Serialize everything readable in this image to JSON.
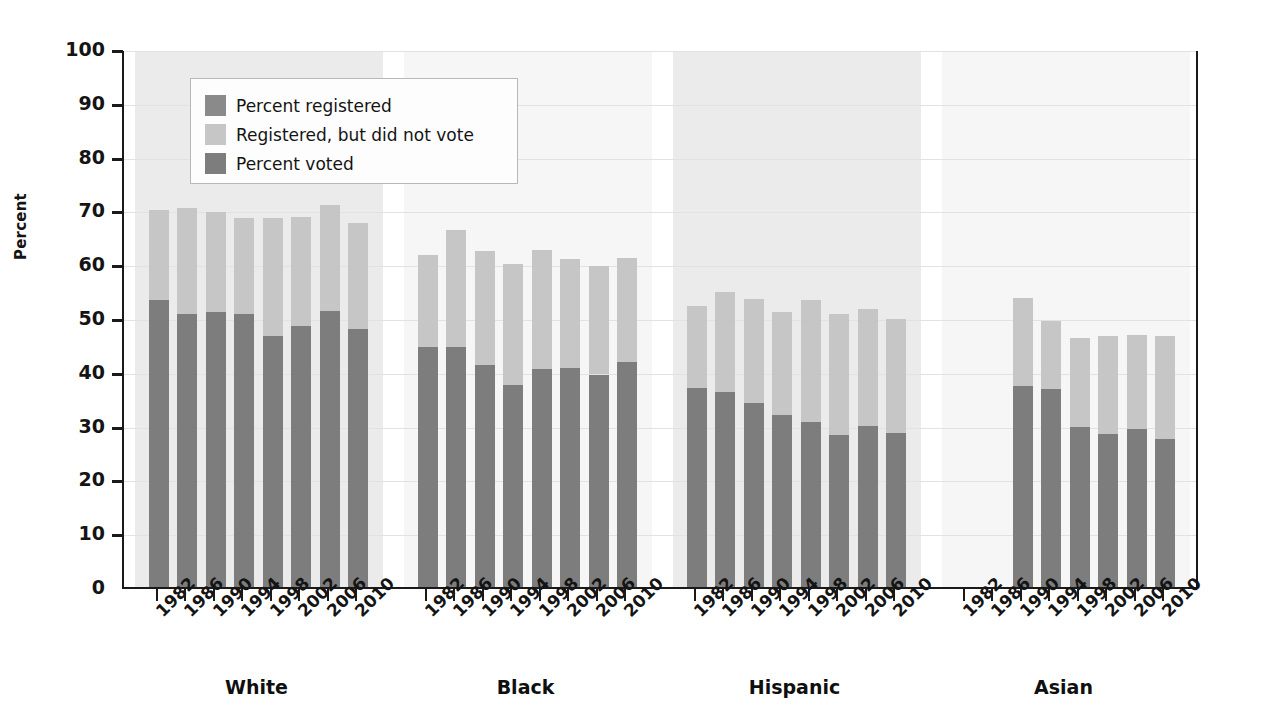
{
  "chart_data": {
    "type": "bar",
    "title": "",
    "subtitle": "",
    "xlabel": "",
    "ylabel": "Percent",
    "ylim": [
      0,
      100
    ],
    "ytick_step": 10,
    "yticks": [
      "100",
      "90",
      "80",
      "70",
      "60",
      "50",
      "40",
      "30",
      "20",
      "10",
      "0"
    ],
    "grid": true,
    "stacked": true,
    "legend_position": "upper-left-inside",
    "legend": [
      {
        "label": "Percent registered",
        "color": "#8a8a8a"
      },
      {
        "label": "Registered, but did not vote",
        "color": "#c6c6c6"
      },
      {
        "label": "Percent voted",
        "color": "#7d7d7d"
      }
    ],
    "categories": [
      "1982",
      "1986",
      "1990",
      "1994",
      "1998",
      "2002",
      "2006",
      "2010"
    ],
    "groups": [
      {
        "name": "White",
        "registered": [
          70.0,
          70.4,
          69.7,
          68.5,
          68.6,
          68.8,
          71.0,
          67.7
        ],
        "voted": [
          53.4,
          50.7,
          51.2,
          50.8,
          46.7,
          48.6,
          51.3,
          48.0
        ]
      },
      {
        "name": "Black",
        "registered": [
          61.7,
          66.3,
          62.4,
          60.1,
          62.6,
          61.0,
          59.6,
          61.2
        ],
        "voted": [
          44.7,
          44.6,
          41.2,
          37.5,
          40.5,
          40.8,
          39.5,
          41.8
        ]
      },
      {
        "name": "Hispanic",
        "registered": [
          52.2,
          54.9,
          53.6,
          51.2,
          53.4,
          50.7,
          51.7,
          49.8
        ],
        "voted": [
          36.9,
          36.2,
          34.2,
          31.9,
          30.7,
          28.3,
          30.0,
          28.6
        ]
      },
      {
        "name": "Asian",
        "registered": [
          null,
          null,
          53.7,
          49.5,
          46.2,
          46.6,
          46.8,
          46.6
        ],
        "voted": [
          null,
          null,
          37.4,
          36.8,
          29.7,
          28.4,
          29.4,
          27.6
        ]
      }
    ],
    "colors": {
      "registered_remainder": "#c6c6c6",
      "voted": "#7d7d7d",
      "band_a": "#ebebeb",
      "band_b": "#f6f6f6",
      "axis": "#1a1a1a",
      "gridline": "#e2e2e2",
      "text": "#141414"
    }
  }
}
